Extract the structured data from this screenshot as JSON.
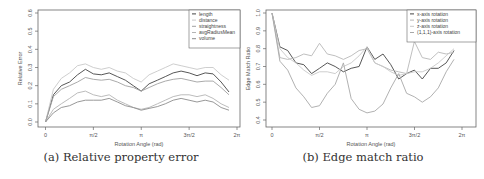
{
  "captions": {
    "a": "(a) Relative property error",
    "b": "(b) Edge match ratio"
  },
  "chart_data": [
    {
      "type": "line",
      "title": "",
      "xlabel": "Rotation Angle (rad)",
      "ylabel": "Relative Error",
      "xlim": [
        0,
        6.2832
      ],
      "ylim": [
        0,
        0.6
      ],
      "xticks": [
        "0",
        "π/2",
        "π",
        "3π/2",
        "2π"
      ],
      "yticks": [
        "0.0",
        "0.1",
        "0.2",
        "0.3",
        "0.4",
        "0.5",
        "0.6"
      ],
      "grid": false,
      "legend_position": "top-right",
      "x": [
        0,
        0.26,
        0.52,
        0.79,
        1.05,
        1.31,
        1.57,
        1.83,
        2.09,
        2.36,
        2.62,
        2.88,
        3.14,
        3.4,
        3.67,
        3.93,
        4.19,
        4.45,
        4.71,
        4.97,
        5.24,
        5.5,
        5.76,
        6.02
      ],
      "series": [
        {
          "name": "length",
          "color": "#444444",
          "values": [
            0.0,
            0.15,
            0.2,
            0.22,
            0.26,
            0.29,
            0.265,
            0.26,
            0.27,
            0.25,
            0.23,
            0.2,
            0.17,
            0.21,
            0.23,
            0.25,
            0.27,
            0.28,
            0.27,
            0.255,
            0.27,
            0.265,
            0.22,
            0.165
          ]
        },
        {
          "name": "distance",
          "color": "#c8c8c8",
          "values": [
            0.0,
            0.18,
            0.24,
            0.27,
            0.31,
            0.32,
            0.3,
            0.29,
            0.3,
            0.28,
            0.27,
            0.24,
            0.22,
            0.26,
            0.28,
            0.3,
            0.32,
            0.31,
            0.3,
            0.29,
            0.3,
            0.3,
            0.26,
            0.23
          ]
        },
        {
          "name": "straightness",
          "color": "#a0a0a0",
          "values": [
            0.0,
            0.14,
            0.18,
            0.2,
            0.22,
            0.245,
            0.235,
            0.23,
            0.235,
            0.22,
            0.2,
            0.19,
            0.17,
            0.19,
            0.21,
            0.225,
            0.235,
            0.24,
            0.23,
            0.22,
            0.225,
            0.225,
            0.19,
            0.15
          ]
        },
        {
          "name": "avgRadiusMean",
          "color": "#b4b4b4",
          "values": [
            0.0,
            0.07,
            0.1,
            0.13,
            0.16,
            0.17,
            0.15,
            0.14,
            0.15,
            0.12,
            0.1,
            0.08,
            0.07,
            0.08,
            0.1,
            0.12,
            0.14,
            0.15,
            0.15,
            0.14,
            0.15,
            0.13,
            0.1,
            0.08
          ]
        },
        {
          "name": "volume",
          "color": "#8c8c8c",
          "values": [
            0.0,
            0.05,
            0.08,
            0.09,
            0.11,
            0.12,
            0.12,
            0.12,
            0.13,
            0.11,
            0.09,
            0.08,
            0.065,
            0.075,
            0.085,
            0.1,
            0.12,
            0.13,
            0.12,
            0.11,
            0.12,
            0.11,
            0.08,
            0.065
          ]
        }
      ]
    },
    {
      "type": "line",
      "title": "",
      "xlabel": "Rotation Angle (rad)",
      "ylabel": "Edge Match Ratio",
      "xlim": [
        0,
        6.2832
      ],
      "ylim": [
        0.4,
        1.0
      ],
      "xticks": [
        "0",
        "π/2",
        "π",
        "3π/2",
        "2π"
      ],
      "yticks": [
        "0.4",
        "0.5",
        "0.6",
        "0.7",
        "0.8",
        "0.9",
        "1.0"
      ],
      "grid": false,
      "legend_position": "top-right",
      "x": [
        0,
        0.26,
        0.52,
        0.79,
        1.05,
        1.31,
        1.57,
        1.83,
        2.09,
        2.36,
        2.62,
        2.88,
        3.14,
        3.4,
        3.67,
        3.93,
        4.19,
        4.45,
        4.71,
        4.97,
        5.24,
        5.5,
        5.76,
        6.02
      ],
      "series": [
        {
          "name": "x-axis rotation",
          "color": "#444444",
          "values": [
            1.0,
            0.81,
            0.79,
            0.72,
            0.71,
            0.66,
            0.69,
            0.72,
            0.7,
            0.67,
            0.69,
            0.7,
            0.81,
            0.74,
            0.77,
            0.71,
            0.63,
            0.66,
            0.68,
            0.63,
            0.69,
            0.69,
            0.72,
            0.79
          ]
        },
        {
          "name": "y-axis rotation",
          "color": "#b8b8b8",
          "values": [
            1.0,
            0.75,
            0.74,
            0.75,
            0.77,
            0.76,
            0.83,
            0.77,
            0.76,
            0.74,
            0.76,
            0.79,
            0.8,
            0.72,
            0.7,
            0.68,
            0.67,
            0.66,
            0.84,
            0.75,
            0.74,
            0.78,
            0.77,
            0.78
          ]
        },
        {
          "name": "z-axis rotation",
          "color": "#c8c8c8",
          "values": [
            1.0,
            0.8,
            0.75,
            0.72,
            0.68,
            0.65,
            0.67,
            0.67,
            0.66,
            0.7,
            0.72,
            0.76,
            0.81,
            0.72,
            0.7,
            0.67,
            0.65,
            0.66,
            0.67,
            0.67,
            0.69,
            0.72,
            0.76,
            0.8
          ]
        },
        {
          "name": "(1,1,1)-axis rotation",
          "color": "#a8a8a8",
          "values": [
            1.0,
            0.73,
            0.68,
            0.58,
            0.53,
            0.47,
            0.48,
            0.55,
            0.6,
            0.72,
            0.52,
            0.46,
            0.44,
            0.45,
            0.49,
            0.58,
            0.66,
            0.55,
            0.53,
            0.5,
            0.53,
            0.58,
            0.67,
            0.74
          ]
        }
      ]
    }
  ]
}
